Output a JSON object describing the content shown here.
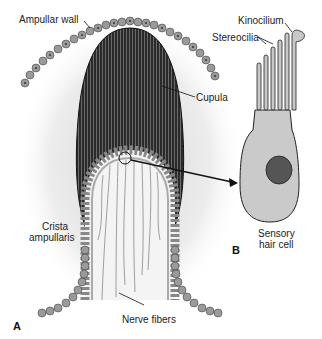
{
  "figure": {
    "panels": [
      {
        "id": "A",
        "label": "A"
      },
      {
        "id": "B",
        "label": "B"
      }
    ],
    "labels": {
      "ampullar_wall": "Ampullar wall",
      "cupula": "Cupula",
      "crista_line1": "Crista",
      "crista_line2": "ampullaris",
      "nerve_fibers": "Nerve fibers",
      "kinocilium": "Kinocilium",
      "stereocilia": "Stereocilia",
      "hair_cell_line1": "Sensory",
      "hair_cell_line2": "hair cell"
    },
    "colors": {
      "cupula": "#2b2b2b",
      "cell_fill": "#9a9a9a",
      "hair_cell_fill": "#c9c9c9",
      "nucleus": "#555555",
      "background_glow": "#e6e6e6"
    }
  }
}
